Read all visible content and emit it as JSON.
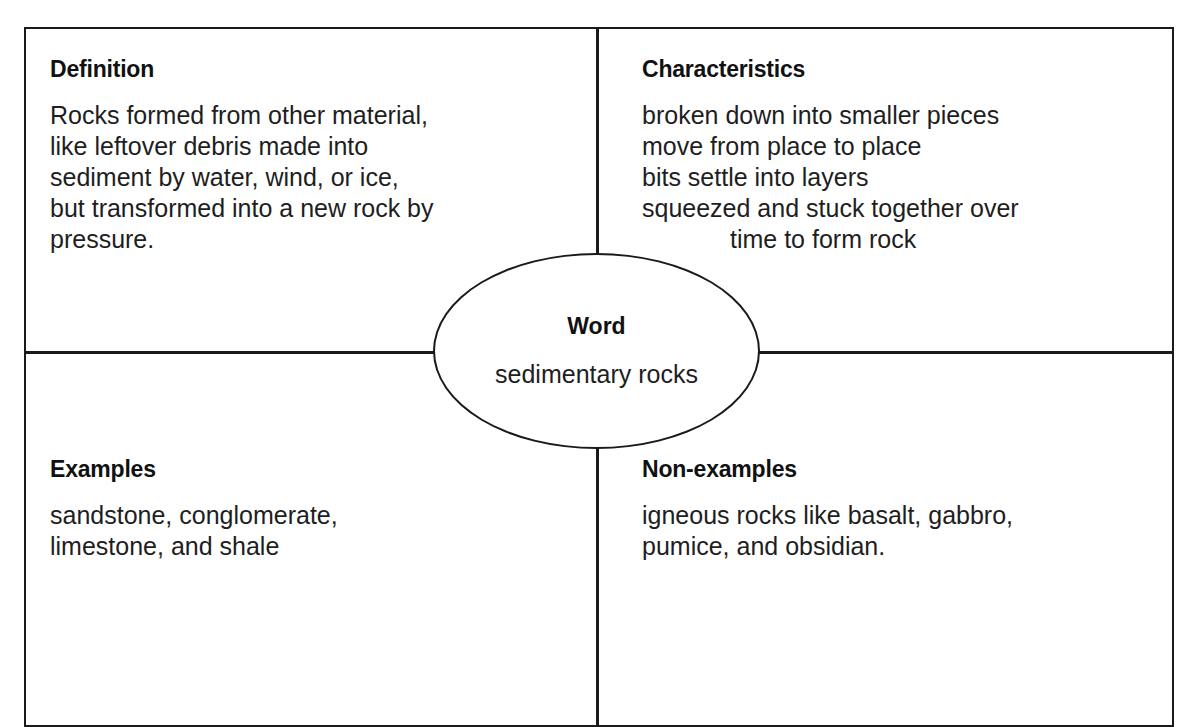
{
  "page": {
    "title_clipped": "Word Map Example"
  },
  "frayer_model": {
    "center": {
      "label": "Word",
      "value": "sedimentary rocks"
    },
    "quadrants": {
      "definition": {
        "heading": "Definition",
        "lines": [
          "Rocks formed from other material,",
          "like leftover debris made into",
          "sediment by water, wind, or ice,",
          "but transformed into a new rock by",
          "pressure."
        ]
      },
      "characteristics": {
        "heading": "Characteristics",
        "lines": [
          "broken down into smaller pieces",
          "move from place to place",
          "bits settle into layers",
          "squeezed and stuck together over",
          "time to form rock"
        ]
      },
      "examples": {
        "heading": "Examples",
        "lines": [
          "sandstone, conglomerate,",
          "limestone, and shale"
        ]
      },
      "non_examples": {
        "heading": "Non-examples",
        "lines": [
          "igneous rocks like basalt, gabbro,",
          "pumice, and obsidian."
        ]
      }
    }
  },
  "colors": {
    "line": "#1a1a1a",
    "background": "#ffffff",
    "text": "#1e1e1e"
  }
}
